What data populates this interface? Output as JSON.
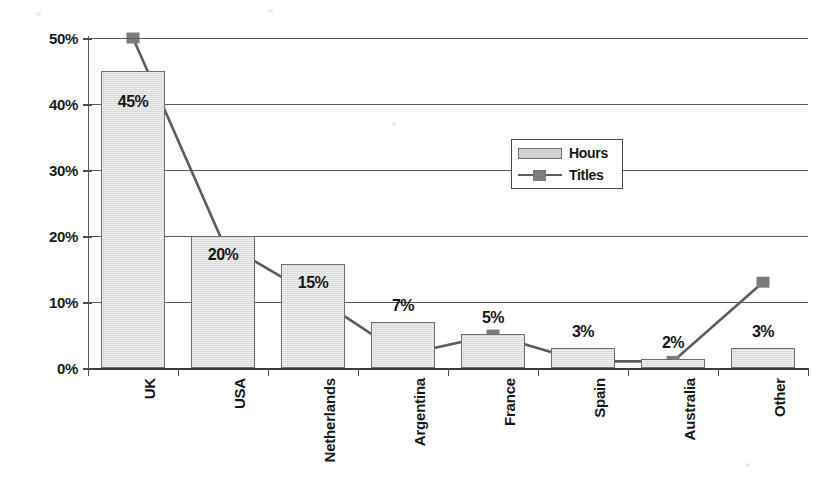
{
  "chart_data": {
    "type": "bar",
    "title": "",
    "subtitle": "",
    "xlabel": "",
    "ylabel": "",
    "ylim": [
      0,
      50
    ],
    "yticks": [
      "0%",
      "10%",
      "20%",
      "30%",
      "40%",
      "50%"
    ],
    "ytick_values": [
      0,
      10,
      20,
      30,
      40,
      50
    ],
    "grid": true,
    "legend_position": "inside-upper-right",
    "categories": [
      "UK",
      "USA",
      "Netherlands",
      "Argentina",
      "France",
      "Spain",
      "Australia",
      "Other"
    ],
    "series": [
      {
        "name": "Hours",
        "type": "bar",
        "values": [
          45,
          20,
          15.7,
          7,
          5.2,
          3,
          1.4,
          3
        ],
        "data_labels": [
          "45%",
          "20%",
          "15%",
          "7%",
          "5%",
          "3%",
          "2%",
          "3%"
        ]
      },
      {
        "name": "Titles",
        "type": "line",
        "values": [
          50,
          19,
          11,
          2,
          5,
          1,
          1,
          13
        ],
        "data_labels": []
      }
    ]
  },
  "legend": {
    "items": [
      {
        "label": "Hours",
        "marker": "bar-swatch",
        "color": "#d2d2d2"
      },
      {
        "label": "Titles",
        "marker": "line-square",
        "color": "#7b7c7e"
      }
    ]
  },
  "colors": {
    "bar_fill": "#d2d2d2",
    "bar_stroke": "#6d6e70",
    "line": "#5c5d5f",
    "marker": "#7b7c7e",
    "axis": "#4a4b4d",
    "grid": "#58595b",
    "text": "#161616",
    "background": "#ffffff"
  }
}
